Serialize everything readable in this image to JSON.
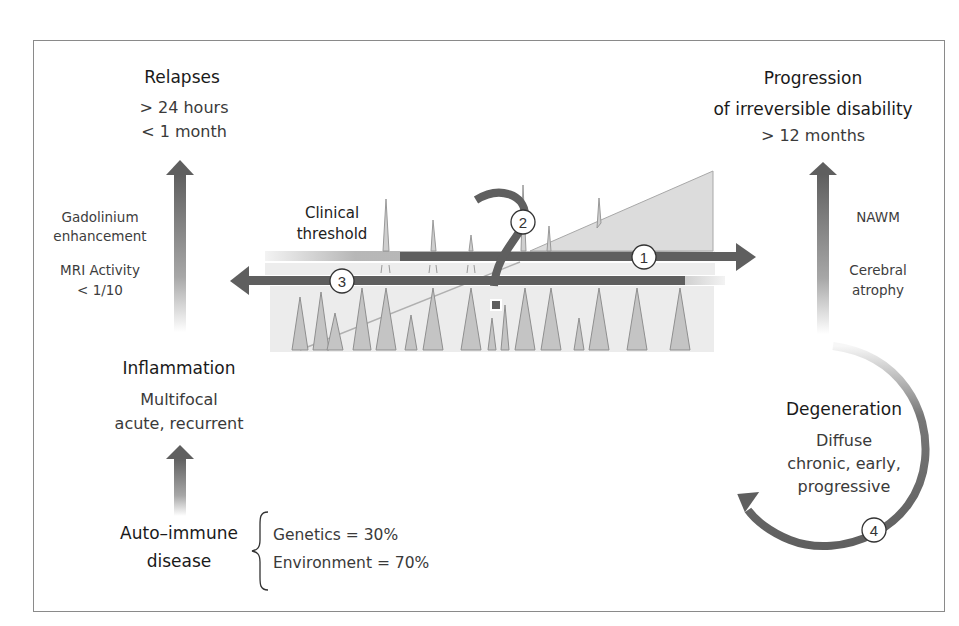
{
  "colors": {
    "arrow_dark": "#5f5f5f",
    "peak_fill": "#c4c4c4",
    "panel_bg": "#ececec",
    "triangle_fill": "#dcdcdc",
    "frame_border": "#8a8a8a",
    "text": "#1a1a1a",
    "text_muted": "#3d3d3d"
  },
  "relapses": {
    "title": "Relapses",
    "line1": "> 24 hours",
    "line2": "< 1 month"
  },
  "progression": {
    "title_line1": "Progression",
    "title_line2": "of irreversible disability",
    "duration": "> 12 months"
  },
  "left_notes": {
    "gadolinium_line1": "Gadolinium",
    "gadolinium_line2": "enhancement",
    "mri_line1": "MRI Activity",
    "mri_line2": "< 1/10"
  },
  "right_notes": {
    "nawm": "NAWM",
    "atrophy_line1": "Cerebral",
    "atrophy_line2": "atrophy"
  },
  "threshold": {
    "line1": "Clinical",
    "line2": "threshold"
  },
  "inflammation": {
    "title": "Inflammation",
    "line1": "Multifocal",
    "line2": "acute, recurrent"
  },
  "autoimmune": {
    "title_line1": "Auto–immune",
    "title_line2": "disease",
    "factors": [
      {
        "label": "Genetics = 30%"
      },
      {
        "label": "Environment = 70%"
      }
    ]
  },
  "degeneration": {
    "title": "Degeneration",
    "line1": "Diffuse",
    "line2": "chronic, early,",
    "line3": "progressive"
  },
  "markers": [
    {
      "id": "1",
      "label": "1"
    },
    {
      "id": "2",
      "label": "2"
    },
    {
      "id": "3",
      "label": "3"
    },
    {
      "id": "4",
      "label": "4"
    }
  ]
}
